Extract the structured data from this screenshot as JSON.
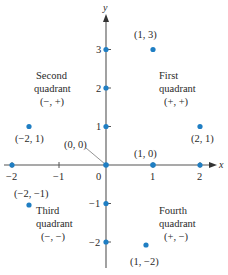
{
  "diagram": {
    "type": "cartesian-coordinate-plane",
    "colors": {
      "axis": "#555555",
      "point": "#1f7ec3",
      "text": "#2a2a2a",
      "leader": "#888888"
    },
    "geometry": {
      "origin_px": [
        106,
        165
      ],
      "unit_x_px": 47,
      "unit_y_px": 38.5
    },
    "axes": {
      "x_label": "x",
      "y_label": "y",
      "x_ticks": [
        {
          "value": -2,
          "label": "−2"
        },
        {
          "value": -1,
          "label": "−1"
        },
        {
          "value": 0,
          "label": "0"
        },
        {
          "value": 1,
          "label": "1"
        },
        {
          "value": 2,
          "label": "2"
        }
      ],
      "y_ticks": [
        {
          "value": 3,
          "label": "3"
        },
        {
          "value": 2,
          "label": "2"
        },
        {
          "value": 1,
          "label": "1"
        },
        {
          "value": -1,
          "label": "−1"
        },
        {
          "value": -2,
          "label": "−2"
        }
      ]
    },
    "points": [
      {
        "x": 1,
        "y": 3,
        "label": "(1, 3)"
      },
      {
        "x": 2,
        "y": 1,
        "label": "(2, 1)"
      },
      {
        "x": -2,
        "y": 1,
        "label": "(−2, 1)"
      },
      {
        "x": 0,
        "y": 0,
        "label": "(0, 0)"
      },
      {
        "x": 1,
        "y": 0,
        "label": "(1, 0)"
      },
      {
        "x": -2,
        "y": -1,
        "label": "(−2, −1)"
      },
      {
        "x": 1,
        "y": -2,
        "label": "(1, −2)"
      }
    ],
    "quadrants": [
      {
        "name": "First",
        "word": "quadrant",
        "signs": "(+, +)"
      },
      {
        "name": "Second",
        "word": "quadrant",
        "signs": "(−, +)"
      },
      {
        "name": "Third",
        "word": "quadrant",
        "signs": "(−, −)"
      },
      {
        "name": "Fourth",
        "word": "quadrant",
        "signs": "(+, −)"
      }
    ]
  }
}
